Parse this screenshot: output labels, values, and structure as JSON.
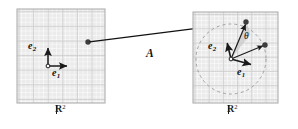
{
  "figure": {
    "background_color": "#ffffff",
    "width": 298,
    "height": 129
  },
  "colors": {
    "panel_fill": "#ebebeb",
    "panel_border": "#b3b3b3",
    "grid_line": "#ffffff",
    "grid_line_major": "#cfcfcf",
    "vector_stroke": "#1a1a1a",
    "arrow_map": "#111111",
    "dashed_circle": "#9a9a9a",
    "wedge_fill": "#c8c8c8",
    "dot_fill": "#3d3d3d",
    "text": "#111111"
  },
  "panels": [
    {
      "id": "domain-panel",
      "name": "left-plane",
      "space_label": "R",
      "space_exponent": "2",
      "x": 17,
      "y": 9,
      "width": 88,
      "height": 94,
      "grid_step": 14.6,
      "origin": {
        "x": 48,
        "y": 66
      },
      "basis": [
        {
          "name": "e1",
          "label": "e",
          "subscript": "1",
          "dx": 21,
          "dy": 0,
          "label_x": 52,
          "label_y": 72
        },
        {
          "name": "e2",
          "label": "e",
          "subscript": "2",
          "dx": 0,
          "dy": -20,
          "label_x": 28,
          "label_y": 44
        }
      ],
      "point": {
        "x": 88,
        "y": 42,
        "radius": 2.6
      }
    },
    {
      "id": "codomain-panel",
      "name": "right-plane",
      "space_label": "R",
      "space_exponent": "2",
      "x": 193,
      "y": 12,
      "width": 85,
      "height": 91,
      "grid_step": 14.2,
      "origin": {
        "x": 231,
        "y": 59
      },
      "basis": [
        {
          "name": "e1",
          "label": "e",
          "subscript": "1",
          "dx": 24,
          "dy": 7,
          "label_x": 238,
          "label_y": 70
        },
        {
          "name": "e2",
          "label": "e",
          "subscript": "2",
          "dx": -4,
          "dy": -18,
          "label_x": 209,
          "label_y": 46
        }
      ],
      "circle": {
        "cx": 231,
        "cy": 59,
        "r": 35,
        "dash": "3 3"
      },
      "angle": {
        "symbol": "θ",
        "label_x": 243,
        "label_y": 36,
        "wedge_radius": 19
      },
      "points": [
        {
          "name": "image-point-top",
          "x": 246,
          "y": 22,
          "radius": 2.6
        },
        {
          "name": "image-point-right",
          "x": 265,
          "y": 45,
          "radius": 2.6
        }
      ]
    }
  ],
  "map_arrow": {
    "name": "linear-map-arrow",
    "label": "A",
    "label_x": 147,
    "label_y": 54,
    "from": {
      "x": 88,
      "y": 42
    },
    "to": {
      "x": 246,
      "y": 22
    },
    "stroke_width": 1.2
  },
  "space_labels": [
    {
      "name": "domain-space-label",
      "text": "R",
      "exponent": "2",
      "x": 56,
      "y": 108
    },
    {
      "name": "codomain-space-label",
      "text": "R",
      "exponent": "2",
      "x": 228,
      "y": 108
    }
  ]
}
